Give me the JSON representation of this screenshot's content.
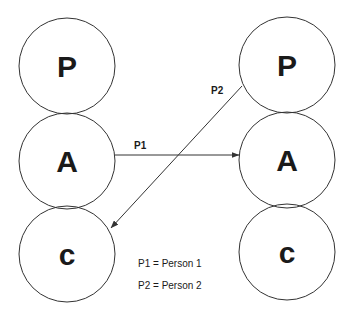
{
  "diagram": {
    "type": "state-transition",
    "colors": {
      "background": "#ffffff",
      "stroke": "#333333",
      "text": "#1a1a1a"
    },
    "left_column": {
      "nodes": [
        {
          "id": "left-P",
          "label": "P"
        },
        {
          "id": "left-A",
          "label": "A"
        },
        {
          "id": "left-C",
          "label": "c"
        }
      ]
    },
    "right_column": {
      "nodes": [
        {
          "id": "right-P",
          "label": "P"
        },
        {
          "id": "right-A",
          "label": "A"
        },
        {
          "id": "right-C",
          "label": "c"
        }
      ]
    },
    "edges": [
      {
        "label": "P1",
        "from": "left-A",
        "to": "right-A"
      },
      {
        "label": "P2",
        "from": "right-P",
        "to": "left-C"
      }
    ],
    "legend": [
      {
        "text": "P1 = Person 1"
      },
      {
        "text": "P2 = Person 2"
      }
    ]
  }
}
